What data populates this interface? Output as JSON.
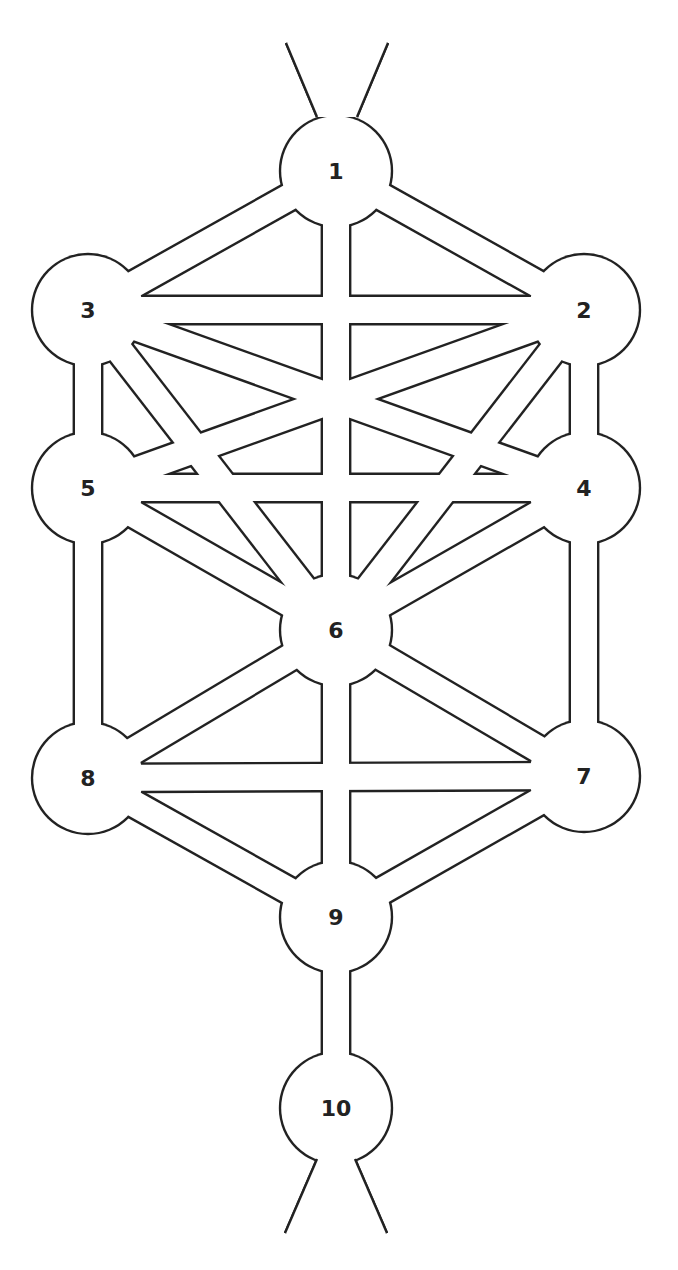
{
  "diagram": {
    "colors": {
      "line": "#222222",
      "fill": "#ffffff",
      "background": "#ffffff"
    },
    "node_radius": 56,
    "channel_width": 26,
    "stroke_width": 2.4,
    "nodes": [
      {
        "id": "1",
        "label": "1",
        "x": 336,
        "y": 171
      },
      {
        "id": "2",
        "label": "2",
        "x": 584,
        "y": 310
      },
      {
        "id": "3",
        "label": "3",
        "x": 88,
        "y": 310
      },
      {
        "id": "4",
        "label": "4",
        "x": 584,
        "y": 488
      },
      {
        "id": "5",
        "label": "5",
        "x": 88,
        "y": 488
      },
      {
        "id": "6",
        "label": "6",
        "x": 336,
        "y": 630
      },
      {
        "id": "7",
        "label": "7",
        "x": 584,
        "y": 776
      },
      {
        "id": "8",
        "label": "8",
        "x": 88,
        "y": 778
      },
      {
        "id": "9",
        "label": "9",
        "x": 336,
        "y": 917
      },
      {
        "id": "10",
        "label": "10",
        "x": 336,
        "y": 1108
      }
    ],
    "paths": [
      [
        "1",
        "2"
      ],
      [
        "1",
        "3"
      ],
      [
        "1",
        "6"
      ],
      [
        "2",
        "3"
      ],
      [
        "2",
        "4"
      ],
      [
        "2",
        "6"
      ],
      [
        "2",
        "5"
      ],
      [
        "3",
        "5"
      ],
      [
        "3",
        "6"
      ],
      [
        "3",
        "4"
      ],
      [
        "4",
        "5"
      ],
      [
        "4",
        "6"
      ],
      [
        "4",
        "7"
      ],
      [
        "5",
        "6"
      ],
      [
        "5",
        "8"
      ],
      [
        "6",
        "7"
      ],
      [
        "6",
        "8"
      ],
      [
        "6",
        "9"
      ],
      [
        "7",
        "8"
      ],
      [
        "7",
        "9"
      ],
      [
        "8",
        "9"
      ],
      [
        "9",
        "10"
      ]
    ],
    "outer_lines": [
      {
        "x1": 286,
        "y1": 43,
        "x2": 317,
        "y2": 117
      },
      {
        "x1": 388,
        "y1": 43,
        "x2": 357,
        "y2": 117
      },
      {
        "x1": 285,
        "y1": 1233,
        "x2": 317,
        "y2": 1159
      },
      {
        "x1": 387,
        "y1": 1233,
        "x2": 355,
        "y2": 1159
      }
    ]
  }
}
